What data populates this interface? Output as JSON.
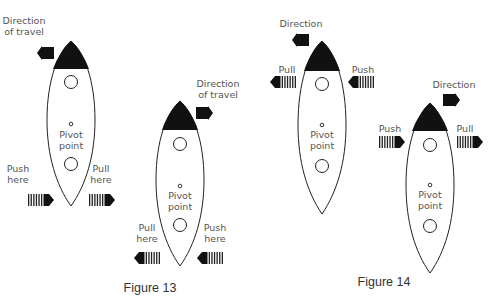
{
  "figure13": {
    "caption": "Figure 13",
    "rocket_a": {
      "direction_line1": "Direction",
      "direction_line2": "of travel",
      "pivot_line1": "Pivot",
      "pivot_line2": "point",
      "left_line1": "Push",
      "left_line2": "here",
      "right_line1": "Pull",
      "right_line2": "here",
      "direction": "left"
    },
    "rocket_b": {
      "direction_line1": "Direction",
      "direction_line2": "of travel",
      "pivot_line1": "Pivot",
      "pivot_line2": "point",
      "left_line1": "Pull",
      "left_line2": "here",
      "right_line1": "Push",
      "right_line2": "here",
      "direction": "right"
    }
  },
  "figure14": {
    "caption": "Figure 14",
    "rocket_a": {
      "direction_label": "Direction",
      "pivot_line1": "Pivot",
      "pivot_line2": "point",
      "left_label": "Pull",
      "right_label": "Push",
      "direction": "left"
    },
    "rocket_b": {
      "direction_label": "Direction",
      "pivot_line1": "Pivot",
      "pivot_line2": "point",
      "left_label": "Push",
      "right_label": "Pull",
      "direction": "right"
    }
  },
  "colors": {
    "nose": "#111111",
    "outline": "#222222",
    "label": "#555555"
  }
}
